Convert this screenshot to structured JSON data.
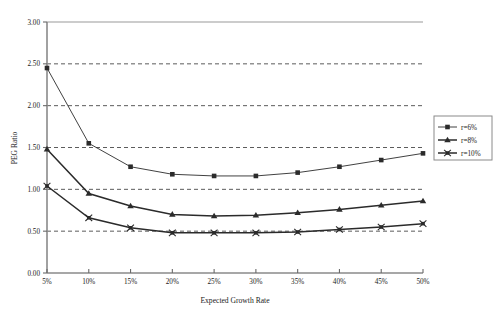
{
  "chart_data": {
    "type": "line",
    "title": "",
    "xlabel": "Expected Growth Rate",
    "ylabel": "PEG Ratio",
    "categories": [
      "5%",
      "10%",
      "15%",
      "20%",
      "25%",
      "30%",
      "35%",
      "40%",
      "45%",
      "50%"
    ],
    "x_tick_labels": [
      "5%",
      "10%",
      "15%",
      "20%",
      "25%",
      "30%",
      "35%",
      "40%",
      "45%",
      "50%"
    ],
    "y_tick_labels": [
      "0.00",
      "0.50",
      "1.00",
      "1.50",
      "2.00",
      "2.50",
      "3.00"
    ],
    "y_tick_values": [
      0.0,
      0.5,
      1.0,
      1.5,
      2.0,
      2.5,
      3.0
    ],
    "ylim": [
      0.0,
      3.0
    ],
    "grid": "horizontal-dashed",
    "legend_position": "right-outside",
    "series": [
      {
        "name": "r=6%",
        "marker": "square",
        "values": [
          2.45,
          1.55,
          1.27,
          1.18,
          1.16,
          1.16,
          1.2,
          1.27,
          1.35,
          1.43
        ]
      },
      {
        "name": "r=8%",
        "marker": "triangle",
        "values": [
          1.48,
          0.95,
          0.8,
          0.7,
          0.68,
          0.69,
          0.72,
          0.76,
          0.81,
          0.86
        ]
      },
      {
        "name": "r=10%",
        "marker": "cross-square",
        "values": [
          1.04,
          0.66,
          0.54,
          0.48,
          0.48,
          0.48,
          0.49,
          0.52,
          0.55,
          0.59
        ]
      }
    ]
  },
  "legend": {
    "entries": [
      {
        "label": "r=6%"
      },
      {
        "label": "r=8%"
      },
      {
        "label": "r=10%"
      }
    ]
  },
  "axes": {
    "x_title": "Expected Growth Rate",
    "y_title": "PEG Ratio"
  },
  "colors": {
    "line": "#2b2b2b",
    "axis": "#7a7a7a",
    "grid": "#555555",
    "background": "#ffffff",
    "text": "#1a1a1a"
  }
}
